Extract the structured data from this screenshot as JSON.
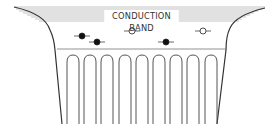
{
  "diagram": {
    "band_label": "CONDUCTION BAND",
    "colors": {
      "line": "#555555",
      "hatch": "#9a9a9a",
      "filled_electron": "#111111",
      "empty_state": "#ffffff"
    },
    "carriers": [
      {
        "type": "filled-electron",
        "x": 82,
        "y": 36
      },
      {
        "type": "filled-electron",
        "x": 97,
        "y": 42
      },
      {
        "type": "empty-state",
        "x": 132,
        "y": 31
      },
      {
        "type": "filled-electron",
        "x": 166,
        "y": 42
      },
      {
        "type": "empty-state",
        "x": 203,
        "y": 31
      }
    ],
    "potential_wells": {
      "count": 9,
      "centers_x": [
        73,
        90,
        107,
        125,
        142,
        159,
        176,
        193,
        211
      ]
    }
  }
}
